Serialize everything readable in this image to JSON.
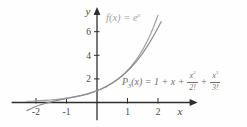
{
  "figure": {
    "background": "#fefefe"
  },
  "chart_data": {
    "type": "line",
    "title": "",
    "xlabel": "x",
    "ylabel": "y",
    "xlim": [
      -2.8,
      3.3
    ],
    "ylim": [
      -1.5,
      8.1
    ],
    "grid": false,
    "legend": "none",
    "axis_color": "#2e2e2e",
    "tick_label_color": "#474747",
    "xticks": {
      "values": [
        -2,
        -1,
        1,
        2
      ],
      "labels": [
        "-2",
        "-1",
        "1",
        "2"
      ]
    },
    "yticks": {
      "values": [
        2,
        4,
        6
      ],
      "labels": [
        "2",
        "4",
        "6"
      ]
    },
    "annotations": [
      {
        "id": "f-label",
        "text": "f(x) = e^x",
        "color": "#a3a3a3",
        "parts": {
          "name": "f",
          "rest": "(x) = e",
          "exp": "x"
        }
      },
      {
        "id": "p3-label",
        "text": "P3(x) = 1 + x + x^2/2! + x^3/3!",
        "color": "#6e6e6e",
        "parts": {
          "name": "P",
          "sub": "3",
          "rest": "(x) = 1 + x +",
          "frac1": {
            "num": "x",
            "sup": "2",
            "den": "2!"
          },
          "plus": "+",
          "frac2": {
            "num": "x",
            "sup": "3",
            "den": "3!"
          }
        }
      }
    ],
    "series": [
      {
        "name": "f(x) = e^x",
        "color": "#a0a0a0",
        "x": [
          -2.3,
          -2.1,
          -1.9,
          -1.7,
          -1.5,
          -1.3,
          -1.1,
          -0.9,
          -0.7,
          -0.5,
          -0.3,
          -0.1,
          0.1,
          0.3,
          0.5,
          0.7,
          0.9,
          1.1,
          1.3,
          1.5,
          1.7,
          1.85,
          2.0
        ],
        "y": [
          0.1,
          0.122,
          0.15,
          0.183,
          0.223,
          0.273,
          0.333,
          0.407,
          0.497,
          0.607,
          0.741,
          0.905,
          1.105,
          1.35,
          1.649,
          2.014,
          2.46,
          3.004,
          3.669,
          4.482,
          5.474,
          6.36,
          7.389
        ]
      },
      {
        "name": "P3(x) = 1 + x + x^2/2! + x^3/3!",
        "color": "#8c8c8c",
        "x": [
          -2.3,
          -2.1,
          -1.9,
          -1.7,
          -1.5,
          -1.3,
          -1.1,
          -0.9,
          -0.7,
          -0.5,
          -0.3,
          -0.1,
          0.1,
          0.3,
          0.5,
          0.7,
          0.9,
          1.1,
          1.3,
          1.5,
          1.7,
          1.9,
          2.1
        ],
        "y": [
          -0.683,
          -0.439,
          -0.238,
          -0.074,
          0.063,
          0.179,
          0.283,
          0.384,
          0.488,
          0.604,
          0.741,
          0.905,
          1.105,
          1.35,
          1.646,
          2.002,
          2.427,
          2.927,
          3.511,
          4.188,
          4.964,
          5.848,
          6.849
        ]
      }
    ]
  }
}
